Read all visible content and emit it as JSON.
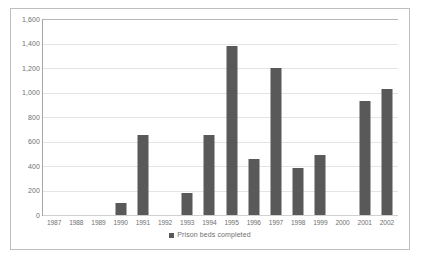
{
  "chart_data": {
    "type": "bar",
    "title": "",
    "xlabel": "",
    "ylabel": "",
    "ylim": [
      0,
      1600
    ],
    "ytick_step": 200,
    "grid": true,
    "legend_position": "bottom",
    "legend": [
      "Prison beds completed"
    ],
    "bar_color": "#595959",
    "gridline_color": "#e4e4e4",
    "axis_color": "#a6a6a6",
    "border_color": "#bfbfbf",
    "label_color": "#6f6f6f",
    "categories": [
      "1987",
      "1988",
      "1989",
      "1990",
      "1991",
      "1992",
      "1993",
      "1994",
      "1995",
      "1996",
      "1997",
      "1998",
      "1999",
      "2000",
      "2001",
      "2002"
    ],
    "ytick_labels": [
      "1,600",
      "1,400",
      "1,200",
      "1,000",
      "800",
      "600",
      "400",
      "200",
      "0"
    ],
    "ytick_values": [
      1600,
      1400,
      1200,
      1000,
      800,
      600,
      400,
      200,
      0
    ],
    "series": [
      {
        "name": "Prison beds completed",
        "values": [
          0,
          0,
          0,
          100,
          650,
          0,
          180,
          650,
          1380,
          455,
          1200,
          385,
          490,
          0,
          930,
          1030
        ]
      }
    ]
  }
}
